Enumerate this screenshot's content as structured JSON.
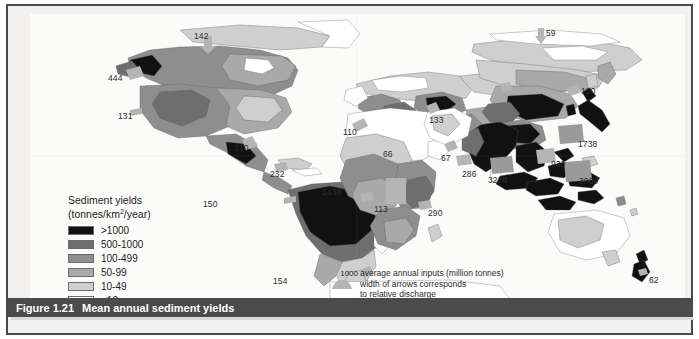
{
  "figure": {
    "number": "Figure 1.21",
    "title": "Mean annual sediment yields"
  },
  "legend": {
    "title": "Sediment yields",
    "units_prefix": "(tonnes/km",
    "units_exponent": "2",
    "units_suffix": "/year)",
    "classes": [
      {
        "label": ">1000",
        "color": "#111111"
      },
      {
        "label": "500-1000",
        "color": "#6e6e6e"
      },
      {
        "label": "100-499",
        "color": "#8e8e8e"
      },
      {
        "label": "50-99",
        "color": "#a9a9a9"
      },
      {
        "label": "10-49",
        "color": "#cfcfcf"
      },
      {
        "label": "<10",
        "color": "#ffffff"
      }
    ]
  },
  "arrow_legend": {
    "value": "1000",
    "line1": "average annual inputs (million tonnes)",
    "line2": "width of arrows corresponds",
    "line3": "to relative discharge"
  },
  "flux_labels": [
    {
      "value": "142",
      "x": 164,
      "y": 17,
      "region": "arctic-canada"
    },
    {
      "value": "444",
      "x": 78,
      "y": 59,
      "region": "alaska"
    },
    {
      "value": "131",
      "x": 88,
      "y": 97,
      "region": "north-pacific-coast"
    },
    {
      "value": "210",
      "x": 204,
      "y": 129,
      "region": "mississippi"
    },
    {
      "value": "232",
      "x": 240,
      "y": 155,
      "region": "caribbean"
    },
    {
      "value": "150",
      "x": 173,
      "y": 185,
      "region": "pacific-south-america"
    },
    {
      "value": "1438",
      "x": 292,
      "y": 173,
      "region": "amazon"
    },
    {
      "value": "154",
      "x": 243,
      "y": 262,
      "region": "south-atlantic"
    },
    {
      "value": "110",
      "x": 313,
      "y": 113,
      "region": "western-europe"
    },
    {
      "value": "66",
      "x": 353,
      "y": 135,
      "region": "mediterranean"
    },
    {
      "value": "133",
      "x": 399,
      "y": 101,
      "region": "black-sea"
    },
    {
      "value": "67",
      "x": 411,
      "y": 139,
      "region": "red-sea"
    },
    {
      "value": "113",
      "x": 344,
      "y": 190,
      "region": "west-africa"
    },
    {
      "value": "290",
      "x": 398,
      "y": 194,
      "region": "east-africa"
    },
    {
      "value": "286",
      "x": 432,
      "y": 155,
      "region": "arabian-sea"
    },
    {
      "value": "3228",
      "x": 458,
      "y": 161,
      "region": "bay-of-bengal"
    },
    {
      "value": "59",
      "x": 516,
      "y": 14,
      "region": "siberian-arctic"
    },
    {
      "value": "100",
      "x": 551,
      "y": 72,
      "region": "north-china"
    },
    {
      "value": "1738",
      "x": 548,
      "y": 125,
      "region": "yellow-sea"
    },
    {
      "value": "930",
      "x": 521,
      "y": 145,
      "region": "south-china"
    },
    {
      "value": "3000",
      "x": 549,
      "y": 162,
      "region": "southeast-asia-islands"
    },
    {
      "value": "62",
      "x": 619,
      "y": 261,
      "region": "new-zealand"
    }
  ]
}
